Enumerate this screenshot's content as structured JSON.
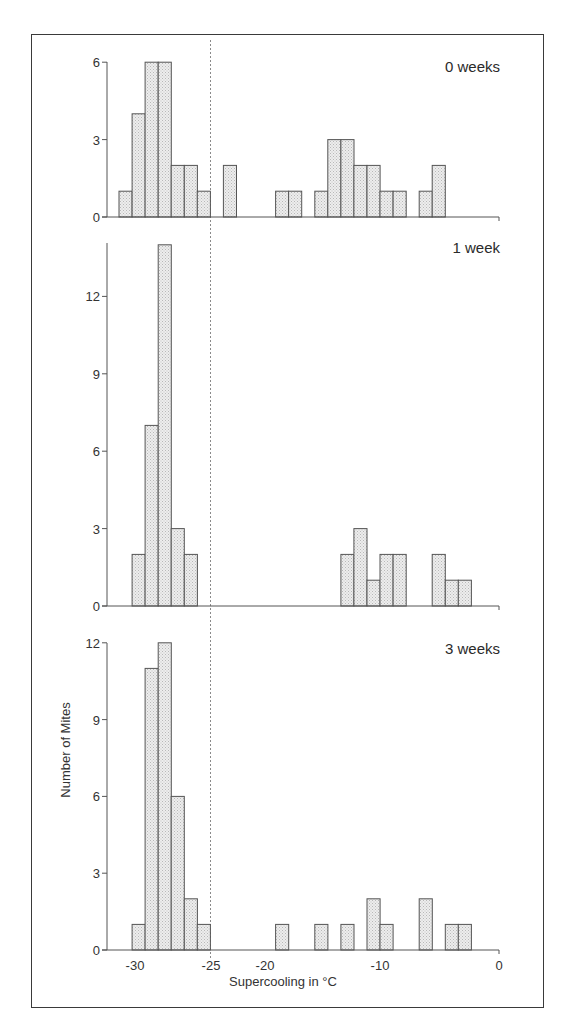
{
  "chart_data": {
    "type": "bar",
    "title": "",
    "xlabel": "Supercooling in °C",
    "ylabel": "Number of Mites",
    "xlim": [
      -32,
      0
    ],
    "x_ticks": [
      "-30",
      "-25",
      "-20",
      "-10",
      "0"
    ],
    "reference_line": {
      "x": -25,
      "style": "dashed"
    },
    "bin_width_c": 1.1,
    "panels": [
      {
        "label": "0 weeks",
        "ylim": [
          0,
          6
        ],
        "y_ticks": [
          "0",
          "3",
          "6"
        ],
        "bars": [
          {
            "bin": 0,
            "x": -30.6,
            "count": 1
          },
          {
            "bin": 1,
            "x": -29.5,
            "count": 4
          },
          {
            "bin": 2,
            "x": -28.4,
            "count": 6
          },
          {
            "bin": 3,
            "x": -27.2,
            "count": 6
          },
          {
            "bin": 4,
            "x": -26.1,
            "count": 2
          },
          {
            "bin": 5,
            "x": -25.0,
            "count": 2
          },
          {
            "bin": 6,
            "x": -23.9,
            "count": 1
          },
          {
            "bin": 8,
            "x": -22.2,
            "count": 2
          },
          {
            "bin": 12,
            "x": -18.7,
            "count": 1
          },
          {
            "bin": 13,
            "x": -17.6,
            "count": 1
          },
          {
            "bin": 15,
            "x": -15.3,
            "count": 1
          },
          {
            "bin": 16,
            "x": -14.2,
            "count": 3
          },
          {
            "bin": 17,
            "x": -13.1,
            "count": 3
          },
          {
            "bin": 18,
            "x": -12.0,
            "count": 2
          },
          {
            "bin": 19,
            "x": -10.8,
            "count": 2
          },
          {
            "bin": 20,
            "x": -9.7,
            "count": 1
          },
          {
            "bin": 21,
            "x": -8.6,
            "count": 1
          },
          {
            "bin": 23,
            "x": -6.3,
            "count": 1
          },
          {
            "bin": 24,
            "x": -5.2,
            "count": 2
          }
        ]
      },
      {
        "label": "1 week",
        "ylim": [
          0,
          14
        ],
        "y_ticks": [
          "0",
          "3",
          "6",
          "9",
          "12"
        ],
        "bars": [
          {
            "bin": 1,
            "x": -29.5,
            "count": 2
          },
          {
            "bin": 2,
            "x": -28.4,
            "count": 7
          },
          {
            "bin": 3,
            "x": -27.2,
            "count": 14
          },
          {
            "bin": 4,
            "x": -26.1,
            "count": 3
          },
          {
            "bin": 5,
            "x": -25.0,
            "count": 2
          },
          {
            "bin": 17,
            "x": -13.1,
            "count": 2
          },
          {
            "bin": 18,
            "x": -12.0,
            "count": 3
          },
          {
            "bin": 19,
            "x": -10.8,
            "count": 1
          },
          {
            "bin": 20,
            "x": -9.7,
            "count": 2
          },
          {
            "bin": 21,
            "x": -8.6,
            "count": 2
          },
          {
            "bin": 24,
            "x": -5.2,
            "count": 2
          },
          {
            "bin": 25,
            "x": -4.1,
            "count": 1
          },
          {
            "bin": 26,
            "x": -3.0,
            "count": 1
          }
        ]
      },
      {
        "label": "3 weeks",
        "ylim": [
          0,
          12
        ],
        "y_ticks": [
          "0",
          "3",
          "6",
          "9",
          "12"
        ],
        "bars": [
          {
            "bin": 1,
            "x": -29.5,
            "count": 1
          },
          {
            "bin": 2,
            "x": -28.4,
            "count": 11
          },
          {
            "bin": 3,
            "x": -27.2,
            "count": 12
          },
          {
            "bin": 4,
            "x": -26.1,
            "count": 6
          },
          {
            "bin": 5,
            "x": -25.0,
            "count": 2
          },
          {
            "bin": 6,
            "x": -23.9,
            "count": 1
          },
          {
            "bin": 12,
            "x": -18.7,
            "count": 1
          },
          {
            "bin": 15,
            "x": -15.3,
            "count": 1
          },
          {
            "bin": 17,
            "x": -13.1,
            "count": 1
          },
          {
            "bin": 19,
            "x": -10.8,
            "count": 2
          },
          {
            "bin": 20,
            "x": -9.7,
            "count": 1
          },
          {
            "bin": 23,
            "x": -6.3,
            "count": 2
          },
          {
            "bin": 25,
            "x": -4.1,
            "count": 1
          },
          {
            "bin": 26,
            "x": -3.0,
            "count": 1
          }
        ]
      }
    ],
    "legend": null,
    "grid": false
  },
  "colors": {
    "bar_fill": "#e4e4e4",
    "bar_stroke": "#555555",
    "axis": "#555555",
    "frame": "#3a3a3a"
  }
}
